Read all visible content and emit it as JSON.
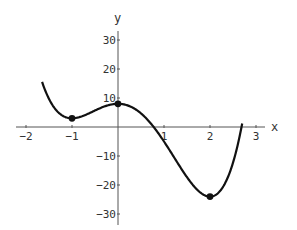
{
  "chart_data": {
    "type": "line",
    "title": "",
    "xlabel": "x",
    "ylabel": "y",
    "xlim": [
      -2.2,
      3.2
    ],
    "ylim": [
      -33,
      33
    ],
    "grid": false,
    "legend": null,
    "x_ticks": [
      -2,
      -1,
      1,
      2,
      3
    ],
    "x_tick_labels": [
      "-2",
      "-1",
      "1",
      "2",
      "3"
    ],
    "y_ticks": [
      30,
      20,
      10,
      -10,
      -20,
      -30
    ],
    "y_tick_labels": [
      "30",
      "20",
      "10",
      "-10",
      "-20",
      "-30"
    ],
    "function": "y = 3x^4 - 4x^3 - 12x^2 + 8",
    "series": [
      {
        "name": "curve",
        "x": [
          -1.65,
          -1.5,
          -1.25,
          -1.0,
          -0.75,
          -0.5,
          -0.25,
          0.0,
          0.25,
          0.5,
          0.75,
          1.0,
          1.25,
          1.5,
          1.75,
          2.0,
          2.25,
          2.5,
          2.7
        ],
        "y": [
          32.8,
          18.7,
          7.7,
          3.0,
          4.0,
          5.7,
          7.3,
          8.0,
          7.2,
          4.7,
          0.6,
          -5.0,
          -11.3,
          -17.8,
          -22.6,
          -24.0,
          -20.0,
          -7.8,
          8.6
        ]
      }
    ],
    "marked_points": [
      {
        "x": -1,
        "y": 3,
        "label": "local minimum"
      },
      {
        "x": 0,
        "y": 8,
        "label": "local maximum"
      },
      {
        "x": 2,
        "y": -24,
        "label": "local minimum"
      }
    ]
  },
  "axes": {
    "x_label": "x",
    "y_label": "y"
  }
}
